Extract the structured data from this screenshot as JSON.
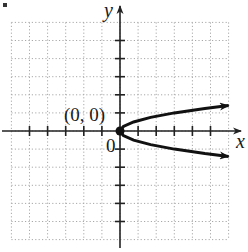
{
  "chart_data": {
    "type": "line",
    "title": "",
    "xlabel": "x",
    "ylabel": "y",
    "xlim": [
      -6,
      6
    ],
    "ylim": [
      -6,
      6
    ],
    "grid": true,
    "grid_style": "dotted",
    "tick_spacing": 1,
    "legend": null,
    "origin_label": "0",
    "series": [
      {
        "name": "parabola opening right",
        "equation_approx": "x = 3y^2",
        "vertex": [
          0,
          0
        ],
        "x": [
          6,
          4.69,
          3.0,
          1.69,
          0.75,
          0.19,
          0,
          0.19,
          0.75,
          1.69,
          3.0,
          4.69,
          6
        ],
        "y": [
          1.41,
          1.25,
          1.0,
          0.75,
          0.5,
          0.25,
          0,
          -0.25,
          -0.5,
          -0.75,
          -1.0,
          -1.25,
          -1.41
        ],
        "arrows_at_ends": true
      }
    ],
    "annotations": [
      {
        "text": "(0, 0)",
        "point": [
          0,
          0
        ],
        "marker": "filled-dot"
      }
    ]
  },
  "labels": {
    "x_axis": "x",
    "y_axis": "y",
    "origin": "0",
    "vertex": "(0, 0)"
  },
  "colors": {
    "curve": "#111111",
    "axis": "#222222",
    "grid": "#9a9a9a"
  }
}
